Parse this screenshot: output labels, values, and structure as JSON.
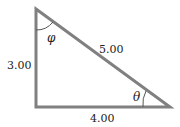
{
  "diagram": {
    "type": "right-triangle",
    "vertices": {
      "top": [
        36,
        9
      ],
      "bottom_left": [
        36,
        107
      ],
      "right": [
        170,
        107
      ]
    },
    "right_angle_at": "bottom_left",
    "sides": {
      "vertical": "3.00",
      "hypotenuse": "5.00",
      "horizontal": "4.00"
    },
    "angles": {
      "top": "φ",
      "right": "θ"
    },
    "colors": {
      "line": "#808080",
      "text": "#222222",
      "background": "#ffffff"
    }
  }
}
